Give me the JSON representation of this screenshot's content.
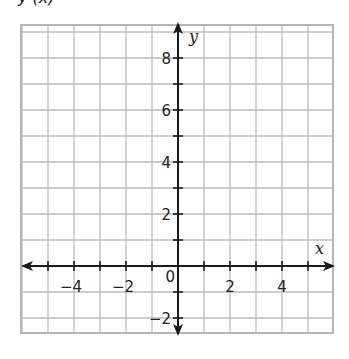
{
  "header": {
    "cutoff_text": "y (x)"
  },
  "graph": {
    "x_axis_label": "x",
    "y_axis_label": "y",
    "x_tick_labels": [
      {
        "value": -4,
        "text": "−4"
      },
      {
        "value": -2,
        "text": "−2"
      },
      {
        "value": 0,
        "text": "0"
      },
      {
        "value": 2,
        "text": "2"
      },
      {
        "value": 4,
        "text": "4"
      }
    ],
    "y_tick_labels": [
      {
        "value": 8,
        "text": "8"
      },
      {
        "value": 6,
        "text": "6"
      },
      {
        "value": 4,
        "text": "4"
      },
      {
        "value": 2,
        "text": "2"
      },
      {
        "value": -2,
        "text": "−2"
      }
    ],
    "x_range": [
      -6,
      6
    ],
    "y_range": [
      -3,
      9
    ],
    "grid_color": "#bdbdbd",
    "axis_color": "#1a1a1a"
  },
  "chart_data": {
    "type": "scatter",
    "title": "",
    "xlabel": "x",
    "ylabel": "y",
    "xlim": [
      -6,
      6
    ],
    "ylim": [
      -3,
      9
    ],
    "x_ticks": [
      -4,
      -2,
      0,
      2,
      4
    ],
    "y_ticks": [
      -2,
      2,
      4,
      6,
      8
    ],
    "grid": true,
    "series": []
  }
}
